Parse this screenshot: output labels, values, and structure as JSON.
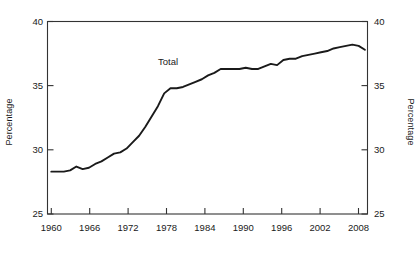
{
  "figure": {
    "background_color": "#ffffff",
    "line_color": "#1a1a1a",
    "axis_color": "#333333"
  },
  "axes": {
    "left_label": "Percentage",
    "right_label": "Percentage",
    "y_ticks": [
      "25",
      "30",
      "35",
      "40"
    ],
    "x_ticks": [
      "1960",
      "1966",
      "1972",
      "1978",
      "1984",
      "1990",
      "1996",
      "2002",
      "2008"
    ]
  },
  "annotations": {
    "series_label": "Total"
  },
  "caption": {
    "text": ""
  },
  "chart_data": {
    "type": "line",
    "title": "",
    "subtitle": "",
    "xlabel": "",
    "ylabel": "Percentage",
    "y2label": "Percentage",
    "xlim": [
      1960,
      2010
    ],
    "ylim": [
      25,
      40
    ],
    "yticks": [
      25,
      30,
      35,
      40
    ],
    "xticks": [
      1960,
      1966,
      1972,
      1978,
      1984,
      1990,
      1996,
      2002,
      2008
    ],
    "grid": false,
    "legend": "inline-annotation",
    "legend_position": "above-line-near-1977",
    "series": [
      {
        "name": "Total",
        "x": [
          1960,
          1961,
          1962,
          1963,
          1964,
          1965,
          1966,
          1967,
          1968,
          1969,
          1970,
          1971,
          1972,
          1973,
          1974,
          1975,
          1976,
          1977,
          1978,
          1979,
          1980,
          1981,
          1982,
          1983,
          1984,
          1985,
          1986,
          1987,
          1988,
          1989,
          1990,
          1991,
          1992,
          1993,
          1994,
          1995,
          1996,
          1997,
          1998,
          1999,
          2000,
          2001,
          2002,
          2003,
          2004,
          2005,
          2006,
          2007,
          2008,
          2009,
          2010
        ],
        "values": [
          28.3,
          28.3,
          28.3,
          28.4,
          28.7,
          28.5,
          28.6,
          28.9,
          29.1,
          29.4,
          29.7,
          29.8,
          30.1,
          30.6,
          31.1,
          31.8,
          32.6,
          33.4,
          34.4,
          34.8,
          34.8,
          34.9,
          35.1,
          35.3,
          35.5,
          35.8,
          36.0,
          36.3,
          36.3,
          36.3,
          36.3,
          36.4,
          36.3,
          36.3,
          36.5,
          36.7,
          36.6,
          37.0,
          37.1,
          37.1,
          37.3,
          37.4,
          37.5,
          37.6,
          37.7,
          37.9,
          38.0,
          38.1,
          38.2,
          38.1,
          37.8
        ]
      }
    ]
  }
}
